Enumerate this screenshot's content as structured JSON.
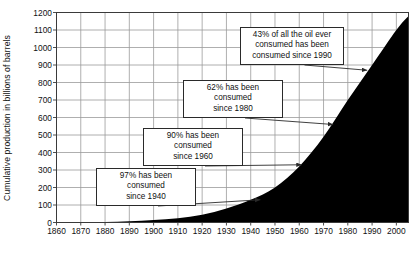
{
  "chart_data": {
    "type": "area",
    "title": "",
    "xlabel": "",
    "ylabel": "Cumulative production in billions of barrels",
    "xlim": [
      1860,
      2005
    ],
    "ylim": [
      0,
      1200
    ],
    "grid": true,
    "legend": null,
    "x_ticks": [
      "1860",
      "1870",
      "1880",
      "1890",
      "1900",
      "1910",
      "1920",
      "1930",
      "1940",
      "1950",
      "1960",
      "1970",
      "1980",
      "1990",
      "2000"
    ],
    "y_ticks": [
      "0",
      "100",
      "200",
      "300",
      "400",
      "500",
      "600",
      "700",
      "800",
      "900",
      "1000",
      "1100",
      "1200"
    ],
    "series": [
      {
        "name": "Cumulative oil production",
        "x": [
          1860,
          1870,
          1880,
          1890,
          1900,
          1910,
          1920,
          1930,
          1940,
          1950,
          1960,
          1970,
          1980,
          1990,
          2000,
          2005
        ],
        "values": [
          0,
          1,
          3,
          7,
          14,
          25,
          45,
          80,
          130,
          200,
          320,
          490,
          700,
          900,
          1100,
          1180
        ]
      }
    ],
    "annotations": [
      {
        "id": "since-1990",
        "text": "43% of all the oil ever\nconsumed has been\nconsumed since 1990",
        "target_year": 1988,
        "target_value": 870
      },
      {
        "id": "since-1980",
        "text": "62% has been consumed\nsince 1980",
        "target_year": 1974,
        "target_value": 560
      },
      {
        "id": "since-1960",
        "text": "90% has been consumed\nsince 1960",
        "target_year": 1961,
        "target_value": 330
      },
      {
        "id": "since-1940",
        "text": "97% has been consumed\nsince 1940",
        "target_year": 1944,
        "target_value": 130
      }
    ],
    "colors": {
      "area_fill": "#000000",
      "grid": "#9a9a9a",
      "axis": "#3a3a3a",
      "background": "#ffffff",
      "annotation_border": "#2a2a2a",
      "text": "#111111"
    }
  }
}
